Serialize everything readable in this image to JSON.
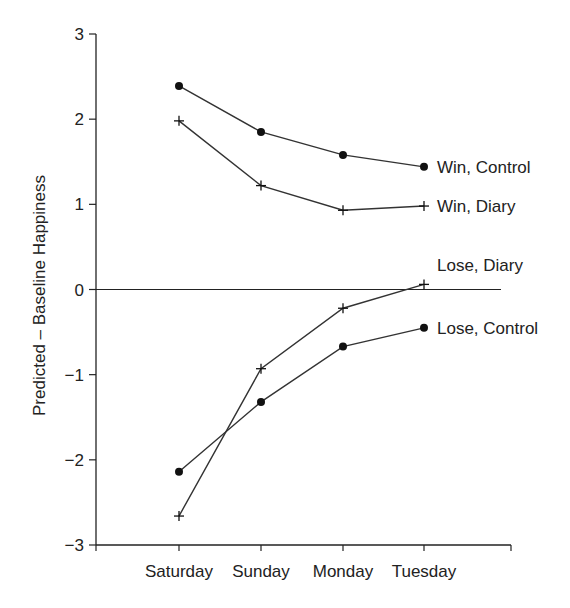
{
  "chart_data": {
    "type": "line",
    "title": "",
    "xlabel": "",
    "ylabel": "Predicted – Baseline Happiness",
    "categories": [
      "Saturday",
      "Sunday",
      "Monday",
      "Tuesday"
    ],
    "ylim": [
      -3,
      3
    ],
    "yticks": [
      "3",
      "2",
      "1",
      "0",
      "−1",
      "−2",
      "−3"
    ],
    "ytick_values": [
      3,
      2,
      1,
      0,
      -1,
      -2,
      -3
    ],
    "reference_line": 0,
    "grid": false,
    "legend_position": "inline-right",
    "series": [
      {
        "name": "Win, Control",
        "marker": "circle",
        "values": [
          2.39,
          1.85,
          1.58,
          1.44
        ]
      },
      {
        "name": "Win, Diary",
        "marker": "plus",
        "values": [
          1.98,
          1.22,
          0.93,
          0.98
        ]
      },
      {
        "name": "Lose, Diary",
        "marker": "plus",
        "values": [
          -2.66,
          -0.93,
          -0.22,
          0.06
        ]
      },
      {
        "name": "Lose, Control",
        "marker": "circle",
        "values": [
          -2.14,
          -1.32,
          -0.67,
          -0.45
        ]
      }
    ],
    "colors": {
      "line": "#333333",
      "axis": "#222222",
      "text": "#222222"
    }
  }
}
